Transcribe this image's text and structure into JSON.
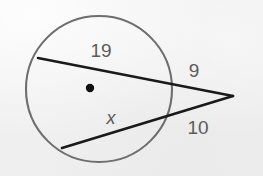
{
  "figure": {
    "kind": "geometry-diagram",
    "topic": "two-secants-from-external-point",
    "width": 263,
    "height": 176,
    "background_color": "#f1f1f1"
  },
  "colors": {
    "background": "#f1f1f1",
    "circle_stroke": "#6e6e6e",
    "secant_stroke": "#1a1a1a",
    "center_dot": "#111111",
    "label_text": "#5b5b5b"
  },
  "circle": {
    "name": "circle",
    "center_x": 99,
    "center_y": 89,
    "radius": 73,
    "stroke_width": 2.1
  },
  "center_point": {
    "name": "center-dot",
    "x": 90,
    "y": 88,
    "radius": 4.2
  },
  "vertex": {
    "name": "external-vertex",
    "x": 233,
    "y": 96
  },
  "secants": [
    {
      "name": "upper-secant",
      "far_x": 38,
      "far_y": 58,
      "near_x": 163,
      "near_y": 85,
      "vertex_x": 233,
      "vertex_y": 96,
      "stroke_width": 2.6,
      "chord_label": "19",
      "external_label": "9"
    },
    {
      "name": "lower-secant",
      "far_x": 62,
      "far_y": 148,
      "near_x": 157,
      "near_y": 118,
      "vertex_x": 233,
      "vertex_y": 96,
      "stroke_width": 2.6,
      "chord_label": "x",
      "external_label": "10"
    }
  ],
  "labels": [
    {
      "name": "label-chord-upper",
      "text": "19",
      "x": 101,
      "y": 52,
      "italic": false
    },
    {
      "name": "label-external-upper",
      "text": "9",
      "x": 194,
      "y": 72,
      "italic": false
    },
    {
      "name": "label-chord-lower",
      "text": "x",
      "x": 111,
      "y": 119,
      "italic": true
    },
    {
      "name": "label-external-lower",
      "text": "10",
      "x": 198,
      "y": 129,
      "italic": false
    }
  ]
}
